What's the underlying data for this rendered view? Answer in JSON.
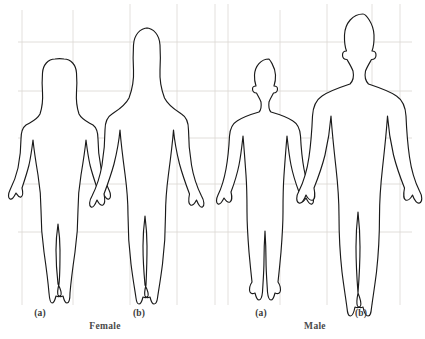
{
  "figure": {
    "background_color": "#ffffff",
    "outline_color": "#1a1a1a",
    "grid_color": "#d8d4d0",
    "captions": {
      "female_a": "(a)",
      "female_b": "(b)",
      "male_a": "(a)",
      "male_b": "(b)",
      "female_group": "Female",
      "male_group": "Male"
    },
    "silhouettes": [
      {
        "name": "female-a",
        "group": "Female",
        "variant": "(a)",
        "hair": "long",
        "build": "slender",
        "relative_height": "short"
      },
      {
        "name": "female-b",
        "group": "Female",
        "variant": "(b)",
        "hair": "long",
        "build": "curvy",
        "relative_height": "tall"
      },
      {
        "name": "male-a",
        "group": "Male",
        "variant": "(a)",
        "hair": "short",
        "build": "average",
        "relative_height": "short"
      },
      {
        "name": "male-b",
        "group": "Male",
        "variant": "(b)",
        "hair": "short",
        "build": "broad",
        "relative_height": "tall"
      }
    ],
    "grid": {
      "horizontal_y": [
        42,
        91,
        138,
        184,
        232
      ],
      "vertical_x": [
        22,
        73,
        130,
        177,
        215,
        228,
        280,
        327,
        372,
        400
      ],
      "visible": true
    }
  }
}
